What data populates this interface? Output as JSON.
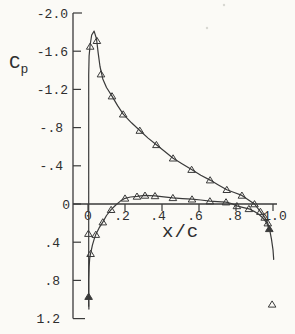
{
  "figure": {
    "background": "#fbfaf6",
    "ink": "#3a3a3a",
    "label_color": "#2e2e2e"
  },
  "labels": {
    "y_axis_main": "C",
    "y_axis_sub": "p",
    "x_axis": "x/c"
  },
  "chart_data": {
    "type": "line",
    "title": "",
    "xlabel": "x/c",
    "ylabel": "Cp",
    "y_axis_inverted": true,
    "ylim": [
      -2.0,
      1.2
    ],
    "xlim": [
      0,
      1.0
    ],
    "grid": false,
    "legend": "none",
    "marker": "open-triangle-up",
    "y_ticks": [
      {
        "v": -2.0,
        "label": "-2.0",
        "label_x": 68,
        "len": 9
      },
      {
        "v": -1.6,
        "label": "-1.6",
        "label_x": 68,
        "len": 8
      },
      {
        "v": -1.2,
        "label": "-1.2",
        "label_x": 68,
        "len": 8
      },
      {
        "v": -0.8,
        "label": "-.8",
        "label_x": 63,
        "len": 8
      },
      {
        "v": -0.4,
        "label": "-.4",
        "label_x": 63,
        "len": 8
      },
      {
        "v": 0.0,
        "label": "0",
        "label_x": 70,
        "len": 8
      },
      {
        "v": 0.4,
        "label": ".4",
        "label_x": 60,
        "len": 8
      },
      {
        "v": 0.8,
        "label": ".8",
        "label_x": 60,
        "len": 8
      },
      {
        "v": 1.2,
        "label": "1.2",
        "label_x": 60,
        "len": 12
      }
    ],
    "x_ticks": [
      {
        "v": 0.0,
        "label": "0",
        "label_x": 88
      },
      {
        "v": 0.2,
        "label": ".2",
        "label_x": 122
      },
      {
        "v": 0.4,
        "label": ".4",
        "label_x": 158
      },
      {
        "v": 0.6,
        "label": ".6",
        "label_x": 195
      },
      {
        "v": 0.8,
        "label": ".8",
        "label_x": 234
      },
      {
        "v": 1.0,
        "label": "1.0",
        "label_x": 275
      }
    ],
    "series": [
      {
        "name": "upper-surface",
        "line": [
          [
            0.004,
            1.07
          ],
          [
            0.004,
            -1.35
          ],
          [
            0.006,
            -1.55
          ],
          [
            0.012,
            -1.67
          ],
          [
            0.02,
            -1.77
          ],
          [
            0.033,
            -1.81
          ],
          [
            0.046,
            -1.73
          ],
          [
            0.055,
            -1.58
          ],
          [
            0.065,
            -1.44
          ],
          [
            0.08,
            -1.31
          ],
          [
            0.1,
            -1.22
          ],
          [
            0.13,
            -1.13
          ],
          [
            0.16,
            -1.03
          ],
          [
            0.19,
            -0.94
          ],
          [
            0.235,
            -0.85
          ],
          [
            0.28,
            -0.77
          ],
          [
            0.325,
            -0.69
          ],
          [
            0.37,
            -0.62
          ],
          [
            0.415,
            -0.55
          ],
          [
            0.46,
            -0.48
          ],
          [
            0.51,
            -0.42
          ],
          [
            0.56,
            -0.36
          ],
          [
            0.61,
            -0.3
          ],
          [
            0.66,
            -0.25
          ],
          [
            0.705,
            -0.2
          ],
          [
            0.75,
            -0.15
          ],
          [
            0.79,
            -0.12
          ],
          [
            0.832,
            -0.09
          ],
          [
            0.87,
            -0.04
          ],
          [
            0.9,
            0.0
          ],
          [
            0.932,
            0.08
          ],
          [
            0.955,
            0.14
          ],
          [
            0.972,
            0.2
          ],
          [
            0.982,
            0.27
          ],
          [
            0.992,
            0.37
          ],
          [
            1.0,
            0.48
          ],
          [
            1.004,
            0.58
          ]
        ],
        "points": [
          [
            0.012,
            -1.65,
            0
          ],
          [
            0.048,
            -1.71,
            0
          ],
          [
            0.07,
            -1.36,
            0
          ],
          [
            0.13,
            -1.13,
            0
          ],
          [
            0.19,
            -0.94,
            0
          ],
          [
            0.28,
            -0.77,
            0
          ],
          [
            0.37,
            -0.62,
            0
          ],
          [
            0.46,
            -0.48,
            0
          ],
          [
            0.56,
            -0.36,
            0
          ],
          [
            0.66,
            -0.25,
            0
          ],
          [
            0.75,
            -0.15,
            0
          ],
          [
            0.832,
            -0.09,
            0
          ],
          [
            0.9,
            0.0,
            0
          ],
          [
            0.932,
            0.08,
            0
          ],
          [
            0.955,
            0.14,
            0
          ],
          [
            0.972,
            0.2,
            0
          ],
          [
            0.98,
            0.26,
            1
          ]
        ]
      },
      {
        "name": "lower-surface",
        "line": [
          [
            0.005,
            1.1
          ],
          [
            0.004,
            0.98
          ],
          [
            0.004,
            0.8
          ],
          [
            0.006,
            0.66
          ],
          [
            0.009,
            0.57
          ],
          [
            0.014,
            0.52
          ],
          [
            0.024,
            0.43
          ],
          [
            0.033,
            0.37
          ],
          [
            0.042,
            0.32
          ],
          [
            0.06,
            0.25
          ],
          [
            0.08,
            0.19
          ],
          [
            0.1,
            0.12
          ],
          [
            0.125,
            0.06
          ],
          [
            0.15,
            0.01
          ],
          [
            0.175,
            -0.03
          ],
          [
            0.2,
            -0.06
          ],
          [
            0.23,
            -0.073
          ],
          [
            0.265,
            -0.08
          ],
          [
            0.308,
            -0.09
          ],
          [
            0.362,
            -0.085
          ],
          [
            0.41,
            -0.075
          ],
          [
            0.459,
            -0.065
          ],
          [
            0.51,
            -0.057
          ],
          [
            0.562,
            -0.05
          ],
          [
            0.61,
            -0.042
          ],
          [
            0.659,
            -0.03
          ],
          [
            0.7,
            -0.025
          ],
          [
            0.746,
            -0.02
          ],
          [
            0.775,
            -0.005
          ],
          [
            0.805,
            0.02
          ],
          [
            0.835,
            0.035
          ],
          [
            0.87,
            0.05
          ],
          [
            0.9,
            0.08
          ],
          [
            0.925,
            0.11
          ],
          [
            0.947,
            0.15
          ],
          [
            0.963,
            0.19
          ],
          [
            0.975,
            0.24
          ]
        ],
        "points": [
          [
            0.003,
            0.97,
            1
          ],
          [
            0.002,
            0.31,
            0
          ],
          [
            0.014,
            0.52,
            0
          ],
          [
            0.042,
            0.32,
            0
          ],
          [
            0.08,
            0.19,
            0
          ],
          [
            0.125,
            0.06,
            0
          ],
          [
            0.2,
            -0.06,
            0
          ],
          [
            0.265,
            -0.08,
            0
          ],
          [
            0.308,
            -0.09,
            0
          ],
          [
            0.362,
            -0.085,
            0
          ],
          [
            0.459,
            -0.065,
            0
          ],
          [
            0.562,
            -0.05,
            0
          ],
          [
            0.659,
            -0.03,
            0
          ],
          [
            0.746,
            -0.02,
            0
          ],
          [
            0.805,
            0.02,
            0
          ],
          [
            0.87,
            0.05,
            0
          ]
        ]
      }
    ],
    "outlier_points": [
      [
        0.995,
        1.05
      ]
    ],
    "scan_artifacts_px": [
      [
        207,
        28
      ],
      [
        224,
        5
      ]
    ]
  }
}
